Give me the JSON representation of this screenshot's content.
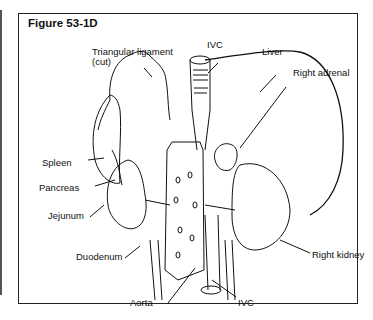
{
  "figure": {
    "title": "Figure 53-1D",
    "labels": {
      "triangular_ligament_1": "Triangular ligament",
      "triangular_ligament_2": "(cut)",
      "ivc_top": "IVC",
      "liver": "Liver",
      "right_adrenal": "Right adrenal",
      "spleen": "Spleen",
      "pancreas": "Pancreas",
      "jejunum": "Jejunum",
      "duodenum": "Duodenum",
      "right_kidney": "Right kidney",
      "aorta": "Aorta",
      "ivc_bottom": "IVC"
    }
  }
}
